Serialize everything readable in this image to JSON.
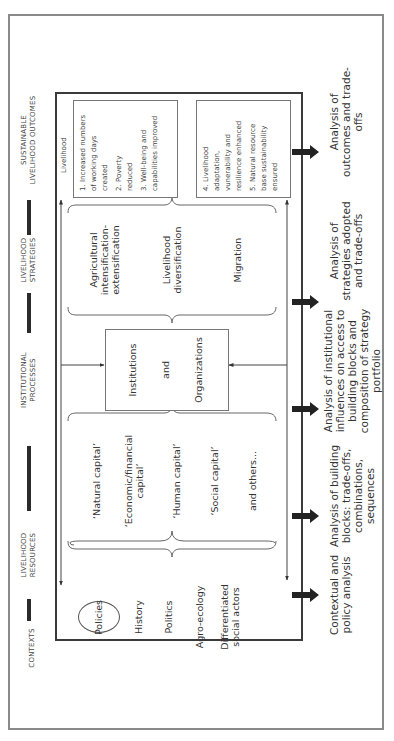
{
  "diagram": {
    "orientation": "rotated-90-ccw",
    "header": {
      "columns": [
        {
          "id": "contexts",
          "lines": [
            "CONTEXTS"
          ]
        },
        {
          "id": "livelihood-resources",
          "lines": [
            "LIVELIHOOD",
            "RESOURCES"
          ]
        },
        {
          "id": "institutional-processes",
          "lines": [
            "INSTITUTIONAL",
            "PROCESSES"
          ]
        },
        {
          "id": "livelihood-strategies",
          "lines": [
            "LIVELIHOOD",
            "STRATEGIES"
          ]
        },
        {
          "id": "sustainable-livelihood-outcomes",
          "lines": [
            "SUSTAINABLE",
            "LIVELIHOOD OUTCOMES"
          ]
        }
      ]
    },
    "contexts": {
      "policies": "Policies",
      "items": [
        "History",
        "Politics",
        "Agro-ecology",
        "Differentiated",
        "social actors"
      ]
    },
    "resources": {
      "items": [
        [
          "‘Natural capital’"
        ],
        [
          "‘Economic/financial",
          "capital’"
        ],
        [
          "‘Human capital’"
        ],
        [
          "‘Social capital’"
        ],
        [
          "and others..."
        ]
      ]
    },
    "institutions": {
      "lines": [
        "Institutions",
        "and",
        "Organizations"
      ]
    },
    "strategies": {
      "items": [
        [
          "Agricultural",
          "intensification-",
          "extensification"
        ],
        [
          "Livelihood",
          "diversification"
        ],
        [
          "Migration"
        ]
      ]
    },
    "outcomes": {
      "label": "Livelihood",
      "box1": [
        [
          "1. Increased numbers",
          "of working days",
          "created"
        ],
        [
          "2. Poverty",
          "reduced"
        ],
        [
          "3. Well-being and",
          "capabilities improved"
        ]
      ],
      "box2": [
        [
          "4. Livelihood",
          "adaptation,",
          "vunerability and",
          "resilience enhanced"
        ],
        [
          "5. Natural resource",
          "base sustainability",
          "ensured"
        ]
      ]
    },
    "analyses": [
      [
        "Contextual and",
        "policy analysis"
      ],
      [
        "Analysis of building",
        "blocks: trade-offs,",
        "combinations,",
        "sequences"
      ],
      [
        "Analysis of institutional",
        "influences on access to",
        "building blocks and",
        "composition of strategy",
        "portfolio"
      ],
      [
        "Analysis of",
        "strategies adopted",
        "and trade-offs"
      ],
      [
        "Analysis of",
        "outcomes and trade-",
        "offs"
      ]
    ],
    "colors": {
      "frame": "#3a3a3a",
      "outer_border": "#8a8a8a",
      "text": "#333333",
      "thick_arrow": "#222222"
    }
  }
}
